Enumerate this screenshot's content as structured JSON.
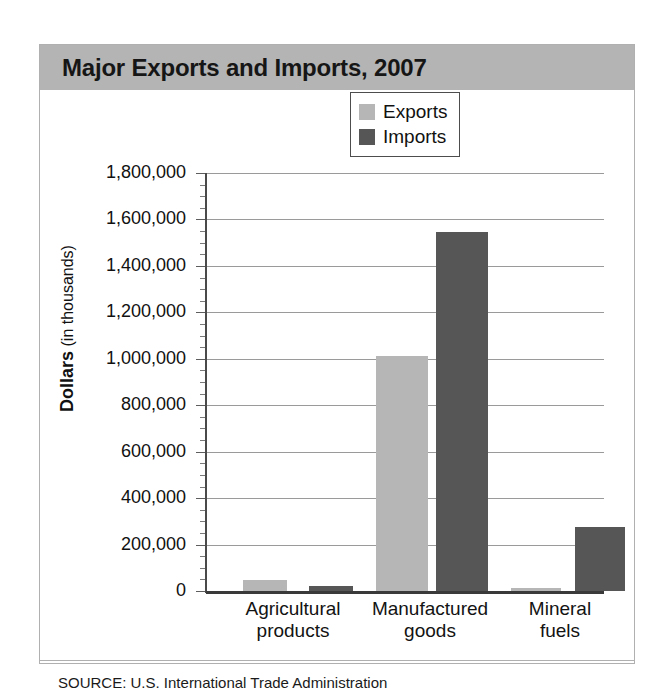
{
  "figure": {
    "title": "Major Exports and Imports, 2007",
    "source_prefix": "SOURCE:",
    "source_text": "U.S. International Trade Administration",
    "colors": {
      "title_band": "#b4b4b4",
      "exports": "#b6b6b6",
      "imports": "#565656",
      "gridline": "#9a9a9a",
      "axis": "#3a3a3a",
      "border": "#b0b0b0"
    }
  },
  "axis": {
    "y_title_bold": "Dollars",
    "y_title_light": " (in thousands)"
  },
  "legend": {
    "entries": [
      {
        "label": "Exports",
        "color": "#b6b6b6"
      },
      {
        "label": "Imports",
        "color": "#565656"
      }
    ]
  },
  "chart_data": {
    "type": "bar",
    "title": "Major Exports and Imports, 2007",
    "xlabel": "",
    "ylabel": "Dollars (in thousands)",
    "ylim": [
      0,
      1800000
    ],
    "ytick_step": 200000,
    "yminor_step": 50000,
    "grid": true,
    "legend_position": "top-right inside plot",
    "categories": [
      "Agricultural products",
      "Manufactured goods",
      "Mineral fuels"
    ],
    "category_lines": [
      [
        "Agricultural",
        "products"
      ],
      [
        "Manufactured",
        "goods"
      ],
      [
        "Mineral",
        "fuels"
      ]
    ],
    "ytick_labels": [
      "0",
      "200,000",
      "400,000",
      "600,000",
      "800,000",
      "1,000,000",
      "1,200,000",
      "1,400,000",
      "1,600,000",
      "1,800,000"
    ],
    "series": [
      {
        "name": "Exports",
        "color": "#b6b6b6",
        "values": [
          48000,
          1010000,
          15000
        ]
      },
      {
        "name": "Imports",
        "color": "#565656",
        "values": [
          20000,
          1545000,
          275000
        ]
      }
    ]
  }
}
